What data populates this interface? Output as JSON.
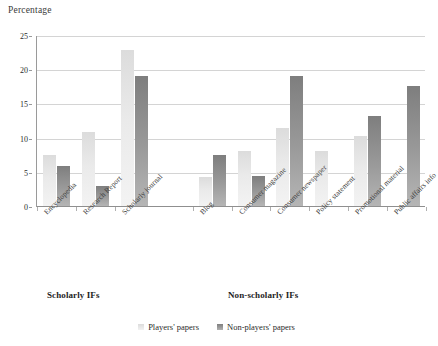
{
  "chart_data": {
    "type": "bar",
    "title": "",
    "subtitle": "",
    "xlabel": "",
    "ylabel": "Percentage",
    "ylim": [
      0,
      25
    ],
    "yticks": [
      0,
      5,
      10,
      15,
      20,
      25
    ],
    "ytick_labels": [
      "0",
      "5",
      "10",
      "15",
      "20",
      "25"
    ],
    "grid": true,
    "legend_position": "bottom",
    "categories": [
      "Encyclopedia",
      "Research Report",
      "Scholarly journal",
      "Blog",
      "Consumer magazine",
      "Consumer newspaper",
      "Policy statement",
      "Promotional material",
      "Public affairs info"
    ],
    "series": [
      {
        "name": "Players' papers",
        "color": "#eaeaea",
        "values": [
          7.5,
          10.8,
          22.8,
          4.2,
          8.1,
          11.4,
          8.0,
          10.2,
          0
        ]
      },
      {
        "name": "Non-players' papers",
        "color": "#9a9a9a",
        "values": [
          5.9,
          2.9,
          19.0,
          7.4,
          4.4,
          19.0,
          0,
          13.2,
          17.6
        ]
      }
    ],
    "groups": [
      {
        "label": "Scholarly IFs",
        "categories": [
          "Encyclopedia",
          "Research Report",
          "Scholarly journal"
        ]
      },
      {
        "label": "Non-scholarly IFs",
        "categories": [
          "Blog",
          "Consumer magazine",
          "Consumer newspaper",
          "Policy statement",
          "Promotional material",
          "Public affairs info"
        ]
      }
    ],
    "annotations": []
  },
  "legend": {
    "items": [
      {
        "label": "Players' papers",
        "swatch": "light-square-icon"
      },
      {
        "label": "Non-players' papers",
        "swatch": "dark-square-icon"
      }
    ]
  },
  "group_labels": {
    "scholarly": "Scholarly IFs",
    "non_scholarly": "Non-scholarly IFs"
  }
}
